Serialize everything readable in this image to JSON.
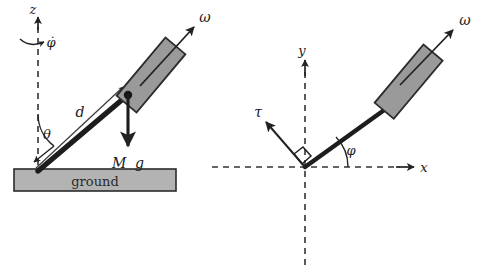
{
  "figure": {
    "colors": {
      "stroke": "#222222",
      "disk_fill": "#9a9a9a",
      "ground_fill": "#b3b3b3",
      "dashed": "#333333",
      "text": "#1a1a1a"
    }
  },
  "side_view": {
    "name": "side-view-panel",
    "axis_label_z": "z",
    "precession_label": "φ̇",
    "angle_label_theta": "θ",
    "distance_label_d": "d",
    "weight_label": "M g",
    "weight_label_parts": {
      "mass": "M",
      "gravity": "g"
    },
    "spin_label_omega": "ω",
    "ground_label": "ground"
  },
  "top_view": {
    "name": "top-view-panel",
    "axis_label_x": "x",
    "axis_label_y": "y",
    "torque_label_tau": "τ",
    "angle_label_phi": "φ",
    "spin_label_omega": "ω",
    "right_angle_marker": "90°"
  }
}
